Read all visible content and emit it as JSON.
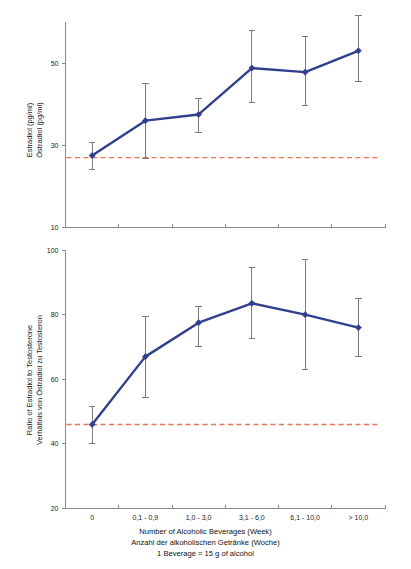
{
  "figure": {
    "background": "#ffffff",
    "series_color": "#31408c",
    "reference_color": "#e8744f",
    "error_color": "#6d6d6d",
    "axis_color": "#8a8a8a"
  },
  "caption": {
    "line1": "Number of Alcoholic Beverages (Week)",
    "line2": "Anzahl der alkoholischen Getränke (Woche)",
    "line3": "1 Beverage = 15 g of alcohol"
  },
  "chart_data": [
    {
      "id": "estradiol",
      "type": "line",
      "title": "",
      "xlabel": "Number of Alcoholic Beverages (Week)",
      "ylabel": "Estradiol (pg/ml)\nÖstradiol (pg/ml)",
      "ylabel_lines": [
        "Estradiol  (pg/ml)",
        "Östradiol (pg/ml)"
      ],
      "categories": [
        "0",
        "0,1 - 0,9",
        "1,0 - 3,0",
        "3,1 - 6,0",
        "6,1 - 10,0",
        "> 10,0"
      ],
      "values": [
        27.5,
        36.0,
        37.5,
        48.8,
        47.8,
        53.0
      ],
      "err_low": [
        24.2,
        26.9,
        33.2,
        40.5,
        39.8,
        45.5
      ],
      "err_high": [
        30.6,
        45.0,
        41.3,
        58.0,
        56.5,
        61.5
      ],
      "ylim": [
        10,
        60
      ],
      "yticks": [
        10,
        30,
        50
      ],
      "ytick_labels": [
        "10",
        "30",
        "50"
      ],
      "reference_line": 27.0,
      "grid": false,
      "legend": "none",
      "xtick_labels_shown": false
    },
    {
      "id": "ratio",
      "type": "line",
      "title": "",
      "xlabel": "Number of Alcoholic Beverages (Week)",
      "ylabel": "Ratio of Estradiol to Testosterone\nVerhältnis von Östradiol zu Testosteron",
      "ylabel_lines": [
        "Ratio of Estradiol to Testosterone",
        "Verhältnis von Östradiol zu Testosteron"
      ],
      "categories": [
        "0",
        "0,1 - 0,9",
        "1,0 - 3,0",
        "3,1 - 6,0",
        "6,1 - 10,0",
        "> 10,0"
      ],
      "values": [
        46.0,
        67.0,
        77.5,
        83.5,
        80.0,
        76.0
      ],
      "err_low": [
        40.0,
        54.5,
        70.0,
        72.5,
        63.0,
        67.0
      ],
      "err_high": [
        51.5,
        79.5,
        82.5,
        94.5,
        97.0,
        85.0
      ],
      "ylim": [
        20,
        100
      ],
      "yticks": [
        20,
        40,
        60,
        80,
        100
      ],
      "ytick_labels": [
        "20",
        "40",
        "60",
        "80",
        "100"
      ],
      "reference_line": 46.0,
      "grid": false,
      "legend": "none",
      "xtick_labels_shown": true
    }
  ]
}
